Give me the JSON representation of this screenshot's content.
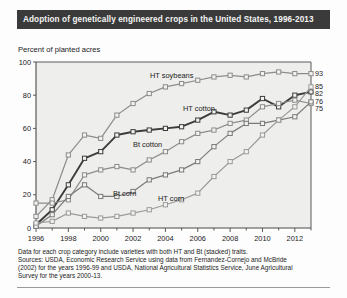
{
  "title": "Adoption of genetically engineered crops in the United States, 1996-2013",
  "subtitle": "Percent of planted acres",
  "footnote": {
    "line1": "Data for each crop category include varieties with both HT and Bt (stacked) traits.",
    "line2": "Sources: USDA, Economic Research Service using data from Fernandez-Cornejo and McBride",
    "line3": "(2002) for the years 1996-99 and USDA, National Agricultural Statistics Service, June Agricultural",
    "line4": "Survey for the years 2000-13."
  },
  "chart_data": {
    "type": "line",
    "title": "Adoption of genetically engineered crops in the United States, 1996-2013",
    "xlabel": "",
    "ylabel": "Percent of planted acres",
    "xlim": [
      1996,
      2013
    ],
    "ylim": [
      0,
      100
    ],
    "yticks": [
      0,
      20,
      40,
      60,
      80,
      100
    ],
    "xticks": [
      1996,
      1998,
      2000,
      2002,
      2004,
      2006,
      2008,
      2010,
      2012
    ],
    "grid": false,
    "legend": "inline-labels",
    "x": [
      1996,
      1997,
      1998,
      1999,
      2000,
      2001,
      2002,
      2003,
      2004,
      2005,
      2006,
      2007,
      2008,
      2009,
      2010,
      2011,
      2012,
      2013
    ],
    "series": [
      {
        "name": "HT soybeans",
        "end_value": 93,
        "color": "#8c8c8c",
        "values": [
          7,
          17,
          44,
          56,
          54,
          68,
          75,
          81,
          85,
          87,
          89,
          91,
          92,
          91,
          93,
          94,
          93,
          93
        ]
      },
      {
        "name": "HT cotton",
        "end_value": 82,
        "color": "#3c3c3c",
        "values": [
          2,
          11,
          26,
          42,
          46,
          56,
          58,
          59,
          60,
          61,
          65,
          70,
          68,
          71,
          78,
          73,
          80,
          82
        ]
      },
      {
        "name": "Bt cotton",
        "end_value": 75,
        "color": "#8c8c8c",
        "values": [
          15,
          15,
          17,
          32,
          35,
          37,
          35,
          41,
          46,
          52,
          57,
          59,
          63,
          65,
          73,
          75,
          77,
          75
        ]
      },
      {
        "name": "Bt corn",
        "end_value": 76,
        "color": "#7a7a7a",
        "values": [
          1,
          8,
          19,
          26,
          19,
          19,
          22,
          29,
          32,
          35,
          40,
          49,
          57,
          63,
          63,
          65,
          67,
          76
        ]
      },
      {
        "name": "HT corn",
        "end_value": 85,
        "color": "#9a9a9a",
        "values": [
          3,
          4,
          9,
          7,
          6,
          7,
          9,
          11,
          14,
          17,
          21,
          31,
          40,
          46,
          56,
          65,
          73,
          85
        ]
      }
    ],
    "end_labels": [
      93,
      85,
      82,
      76,
      75
    ],
    "inline_labels": [
      "HT soybeans",
      "HT cotton",
      "Bt cotton",
      "Bt corn",
      "HT corn"
    ]
  }
}
